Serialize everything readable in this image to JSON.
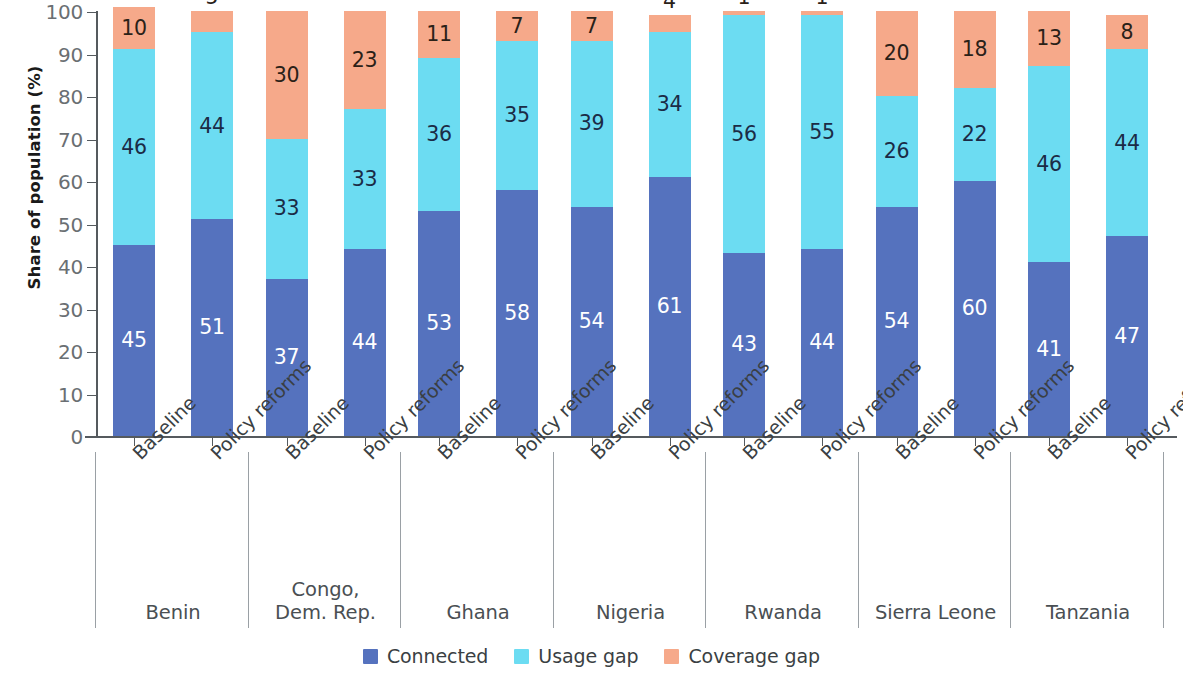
{
  "chart_data": {
    "type": "bar",
    "subtype": "stacked-bar-100",
    "title": "",
    "xlabel": "",
    "ylabel": "Share of population (%)",
    "ylim": [
      0,
      100
    ],
    "ytick_step": 10,
    "yticks": [
      0,
      10,
      20,
      30,
      40,
      50,
      60,
      70,
      80,
      90,
      100
    ],
    "ytick_labels": [
      "0",
      "10",
      "20",
      "30",
      "40",
      "50",
      "60",
      "70",
      "80",
      "90",
      "100"
    ],
    "grid": false,
    "legend_position": "bottom-center",
    "legend": [
      {
        "name": "Connected",
        "color": "#5572be"
      },
      {
        "name": "Usage gap",
        "color": "#6cdcf2"
      },
      {
        "name": "Coverage gap",
        "color": "#f6a98a"
      }
    ],
    "series": [
      {
        "name": "Connected",
        "key": "connected",
        "color": "#5572be",
        "values": [
          45,
          51,
          37,
          44,
          53,
          58,
          54,
          61,
          43,
          44,
          54,
          60,
          41,
          47
        ]
      },
      {
        "name": "Usage gap",
        "key": "usage",
        "color": "#6cdcf2",
        "values": [
          46,
          44,
          33,
          33,
          36,
          35,
          39,
          34,
          56,
          55,
          26,
          22,
          46,
          44
        ]
      },
      {
        "name": "Coverage gap",
        "key": "coverage",
        "color": "#f6a98a",
        "values": [
          10,
          5,
          30,
          23,
          11,
          7,
          7,
          4,
          1,
          1,
          20,
          18,
          13,
          8
        ]
      }
    ],
    "categories": [
      "Baseline",
      "Policy reforms",
      "Baseline",
      "Policy reforms",
      "Baseline",
      "Policy reforms",
      "Baseline",
      "Policy reforms",
      "Baseline",
      "Policy reforms",
      "Baseline",
      "Policy reforms",
      "Baseline",
      "Policy reforms"
    ],
    "groups": [
      {
        "label": "Benin",
        "bars": 2
      },
      {
        "label": "Congo,\nDem. Rep.",
        "bars": 2
      },
      {
        "label": "Ghana",
        "bars": 2
      },
      {
        "label": "Nigeria",
        "bars": 2
      },
      {
        "label": "Rwanda",
        "bars": 2
      },
      {
        "label": "Sierra Leone",
        "bars": 2
      },
      {
        "label": "Tanzania",
        "bars": 2
      }
    ],
    "bars": [
      {
        "group": "Benin",
        "condition": "Baseline",
        "connected": 45,
        "usage": 46,
        "coverage": 10
      },
      {
        "group": "Benin",
        "condition": "Policy reforms",
        "connected": 51,
        "usage": 44,
        "coverage": 5
      },
      {
        "group": "Congo, Dem. Rep.",
        "condition": "Baseline",
        "connected": 37,
        "usage": 33,
        "coverage": 30
      },
      {
        "group": "Congo, Dem. Rep.",
        "condition": "Policy reforms",
        "connected": 44,
        "usage": 33,
        "coverage": 23
      },
      {
        "group": "Ghana",
        "condition": "Baseline",
        "connected": 53,
        "usage": 36,
        "coverage": 11
      },
      {
        "group": "Ghana",
        "condition": "Policy reforms",
        "connected": 58,
        "usage": 35,
        "coverage": 7
      },
      {
        "group": "Nigeria",
        "condition": "Baseline",
        "connected": 54,
        "usage": 39,
        "coverage": 7
      },
      {
        "group": "Nigeria",
        "condition": "Policy reforms",
        "connected": 61,
        "usage": 34,
        "coverage": 4
      },
      {
        "group": "Rwanda",
        "condition": "Baseline",
        "connected": 43,
        "usage": 56,
        "coverage": 1
      },
      {
        "group": "Rwanda",
        "condition": "Policy reforms",
        "connected": 44,
        "usage": 55,
        "coverage": 1
      },
      {
        "group": "Sierra Leone",
        "condition": "Baseline",
        "connected": 54,
        "usage": 26,
        "coverage": 20
      },
      {
        "group": "Sierra Leone",
        "condition": "Policy reforms",
        "connected": 60,
        "usage": 22,
        "coverage": 18
      },
      {
        "group": "Tanzania",
        "condition": "Baseline",
        "connected": 41,
        "usage": 46,
        "coverage": 13
      },
      {
        "group": "Tanzania",
        "condition": "Policy reforms",
        "connected": 47,
        "usage": 44,
        "coverage": 8
      }
    ]
  },
  "colors": {
    "connected": "#5572be",
    "usage_gap": "#6cdcf2",
    "coverage_gap": "#f6a98a",
    "axis": "#555a5e",
    "tick_text": "#6a6f73",
    "label_text": "#3a3f43",
    "background": "#ffffff"
  }
}
